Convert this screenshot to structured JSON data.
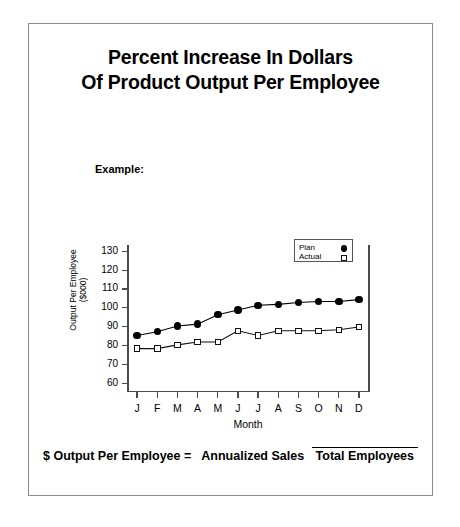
{
  "document": {
    "title_lines": [
      "Percent Increase In Dollars",
      "Of Product Output Per Employee"
    ],
    "example_label": "Example:"
  },
  "formula": {
    "lhs": "$ Output Per Employee =",
    "numerator": "Annualized Sales",
    "denominator": "Total Employees"
  },
  "chart_data": {
    "type": "line",
    "title": "",
    "xlabel": "Month",
    "ylabel": "Output Per Employee ($000)",
    "ylabel_lines": [
      "Output Per Employee",
      "($000)"
    ],
    "categories": [
      "J",
      "F",
      "M",
      "A",
      "M",
      "J",
      "J",
      "A",
      "S",
      "O",
      "N",
      "D"
    ],
    "ylim": [
      55,
      133
    ],
    "yticks": [
      60,
      70,
      80,
      90,
      100,
      110,
      120,
      130
    ],
    "ytick_labels": [
      "60",
      "70",
      "80",
      "90",
      "100",
      "110",
      "120",
      "130"
    ],
    "grid": false,
    "legend_position": "top-right",
    "series": [
      {
        "name": "Plan",
        "marker": "filled-circle",
        "color": "#000000",
        "values": [
          85,
          87,
          90,
          91,
          96,
          98.5,
          101,
          101.5,
          102.5,
          103,
          103,
          104
        ]
      },
      {
        "name": "Actual",
        "marker": "open-square",
        "color": "#111111",
        "values": [
          78,
          78,
          80,
          81.5,
          81.5,
          87.5,
          85,
          87.5,
          87.5,
          87.5,
          88,
          89.5
        ]
      }
    ]
  }
}
